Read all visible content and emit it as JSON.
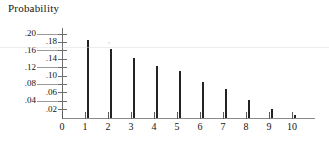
{
  "chart_data": {
    "type": "bar",
    "title": "Probability",
    "xlabel": "",
    "ylabel": "Probability",
    "grid": false,
    "legend": null,
    "xlim": [
      0,
      10
    ],
    "ylim": [
      0,
      0.2
    ],
    "categories": [
      "0",
      "1",
      "2",
      "3",
      "4",
      "5",
      "6",
      "7",
      "8",
      "9",
      "10"
    ],
    "values": [
      0,
      0.185,
      0.165,
      0.142,
      0.125,
      0.112,
      0.085,
      0.068,
      0.042,
      0.022,
      0.006
    ],
    "x_tick_labels": [
      "0",
      "1",
      "2",
      "3",
      "4",
      "5",
      "6",
      "7",
      "8",
      "9",
      "10"
    ],
    "y_tick_labels": [
      ".02",
      ".04",
      ".06",
      ".08",
      ".10",
      ".12",
      ".14",
      ".16",
      ".18",
      ".20"
    ],
    "y_tick_values": [
      0.02,
      0.04,
      0.06,
      0.08,
      0.1,
      0.12,
      0.14,
      0.16,
      0.18,
      0.2
    ],
    "y_label_columns": {
      "outer": [
        ".04",
        ".08",
        ".12",
        ".16",
        ".20"
      ],
      "inner": [
        ".02",
        ".06",
        ".10",
        ".14",
        ".18"
      ]
    },
    "series": [
      {
        "name": "Probability",
        "values": [
          0,
          0.185,
          0.165,
          0.142,
          0.125,
          0.112,
          0.085,
          0.068,
          0.042,
          0.022,
          0.006
        ]
      }
    ],
    "colors": {
      "bar": "#232323",
      "axis": "#6e6e6e",
      "text": "#141414",
      "background": "#ffffff"
    }
  }
}
